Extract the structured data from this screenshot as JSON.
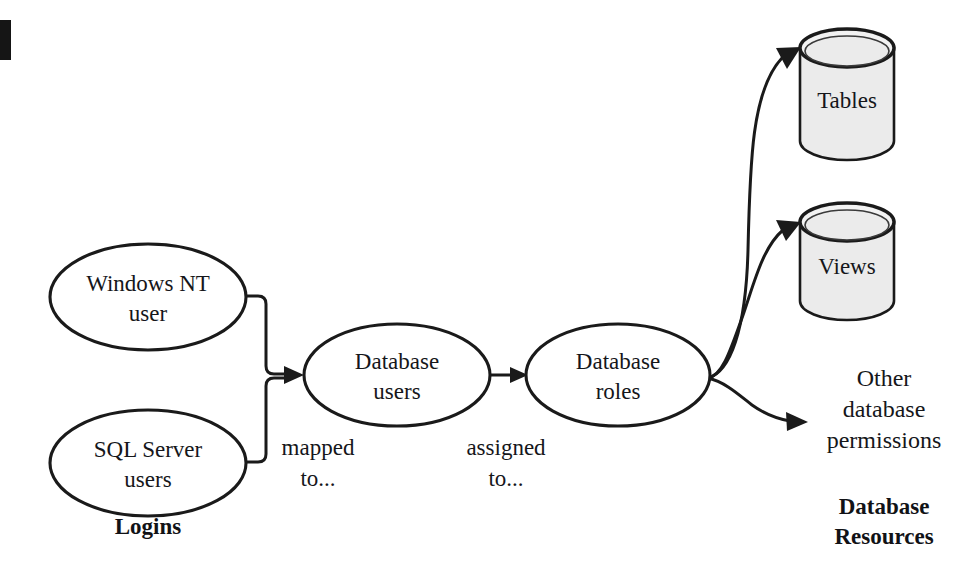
{
  "diagram": {
    "background_color": "#ffffff",
    "stroke_color": "#1a1a1a",
    "cylinder_fill": "#ebebeb",
    "node_fill": "#ffffff"
  },
  "nodes": {
    "windows_nt_user": {
      "line1": "Windows NT",
      "line2": "user",
      "shape": "ellipse"
    },
    "sql_server_users": {
      "line1": "SQL Server",
      "line2": "users",
      "shape": "ellipse"
    },
    "database_users": {
      "line1": "Database",
      "line2": "users",
      "shape": "ellipse"
    },
    "database_roles": {
      "line1": "Database",
      "line2": "roles",
      "shape": "ellipse"
    },
    "tables": {
      "label": "Tables",
      "shape": "cylinder"
    },
    "views": {
      "label": "Views",
      "shape": "cylinder"
    },
    "other_permissions": {
      "line1": "Other",
      "line2": "database",
      "line3": "permissions",
      "shape": "text"
    }
  },
  "edges": {
    "logins_to_users": {
      "line1": "mapped",
      "line2": "to..."
    },
    "users_to_roles": {
      "line1": "assigned",
      "line2": "to..."
    },
    "roles_to_tables": {
      "label": ""
    },
    "roles_to_views": {
      "label": ""
    },
    "roles_to_other": {
      "label": ""
    }
  },
  "groups": {
    "logins": {
      "label": "Logins"
    },
    "database_resources": {
      "line1": "Database",
      "line2": "Resources"
    }
  }
}
